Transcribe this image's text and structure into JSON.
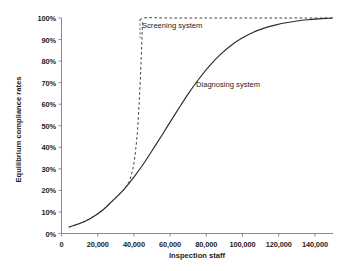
{
  "chart_data": {
    "type": "line",
    "title": "",
    "subtitle": "",
    "xlabel": "Inspection staff",
    "ylabel": "Equilibrium compliance rates",
    "xlim": [
      0,
      150000
    ],
    "ylim": [
      0,
      1.0
    ],
    "grid": false,
    "legend_position": "inline-annotations",
    "xticks": [
      0,
      20000,
      40000,
      60000,
      80000,
      100000,
      120000,
      140000
    ],
    "xticklabels": [
      "0",
      "20,000",
      "40,000",
      "60,000",
      "80,000",
      "100,000",
      "120,000",
      "140,000"
    ],
    "yticks": [
      0,
      0.1,
      0.2,
      0.3,
      0.4,
      0.5,
      0.6,
      0.7,
      0.8,
      0.9,
      1.0
    ],
    "yticklabels": [
      "0%",
      "10%",
      "20%",
      "30%",
      "40%",
      "50%",
      "60%",
      "70%",
      "80%",
      "90%",
      "100%"
    ],
    "annotations": [
      {
        "text": "Screening system",
        "x": 47000,
        "y": 0.965
      },
      {
        "text": "Diagnosing system",
        "x": 76000,
        "y": 0.695
      }
    ],
    "series": [
      {
        "name": "Screening system",
        "style": "dashed",
        "color": "#2b2b2b",
        "x": [
          4000,
          8000,
          12000,
          16000,
          20000,
          24000,
          28000,
          31000,
          34000,
          36000,
          37500,
          39000,
          40000,
          41000,
          42000,
          43000,
          43800,
          44300,
          44600,
          44800,
          45000,
          60000,
          80000,
          100000,
          120000,
          140000,
          150000
        ],
        "y": [
          0.03,
          0.04,
          0.053,
          0.07,
          0.092,
          0.118,
          0.15,
          0.175,
          0.2,
          0.222,
          0.245,
          0.285,
          0.325,
          0.39,
          0.48,
          0.62,
          0.76,
          0.87,
          0.94,
          0.975,
          1.0,
          1.0,
          1.0,
          1.0,
          1.0,
          1.0,
          1.0
        ]
      },
      {
        "name": "Diagnosing system",
        "style": "solid",
        "color": "#2b2b2b",
        "x": [
          4000,
          10000,
          16000,
          22000,
          28000,
          34000,
          40000,
          46000,
          52000,
          58000,
          64000,
          70000,
          76000,
          82000,
          88000,
          94000,
          100000,
          106000,
          112000,
          118000,
          124000,
          130000,
          136000,
          142000,
          148000,
          150000
        ],
        "y": [
          0.03,
          0.046,
          0.07,
          0.103,
          0.15,
          0.2,
          0.262,
          0.332,
          0.41,
          0.49,
          0.57,
          0.648,
          0.718,
          0.78,
          0.832,
          0.875,
          0.908,
          0.934,
          0.953,
          0.967,
          0.978,
          0.986,
          0.992,
          0.996,
          0.999,
          1.0
        ]
      }
    ]
  },
  "axes": {
    "y_title": "Equilibrium compliance rates",
    "x_title": "Inspection staff"
  },
  "colors": {
    "axis": "#808080",
    "curve": "#2b2b2b",
    "text": "#1d1d1d",
    "background": "#ffffff"
  }
}
